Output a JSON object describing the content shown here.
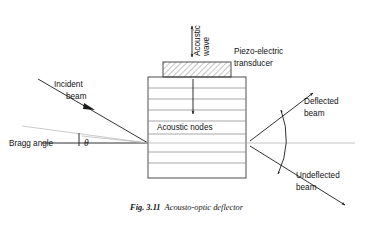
{
  "figure": {
    "caption_number": "Fig. 3.11",
    "caption_text": "Acousto-optic deflector",
    "width": 373,
    "height": 230,
    "background": "#ffffff",
    "ink_color": "#1a1a1a"
  },
  "labels": {
    "acoustic_wave": "Acoustic\nwave",
    "acoustic_wave_line1": "Acoustic",
    "acoustic_wave_line2": "wave",
    "piezo_line1": "Piezo-electric",
    "piezo_line2": "transducer",
    "incident_line1": "Incident",
    "incident_line2": "beam",
    "bragg_angle": "Bragg  angle",
    "theta": "θ",
    "acoustic_nodes": "Acoustic nodes",
    "deflected_line1": "Deflected",
    "deflected_line2": "beam",
    "undeflected_line1": "Undeflected",
    "undeflected_line2": "beam"
  },
  "geometry": {
    "block": {
      "x": 148,
      "y": 77,
      "width": 98,
      "height": 101
    },
    "transducer": {
      "x": 163,
      "y": 62,
      "width": 68,
      "height": 15
    },
    "node_lines_y": [
      88,
      99,
      110,
      121,
      134,
      145,
      156,
      167
    ],
    "interaction_point": {
      "x": 148,
      "y": 143
    },
    "optical_axis_y": 143
  },
  "colors": {
    "ink": "#1a1a1a",
    "block_edge": "#3a3a3a",
    "node_line": "#8a8a8a",
    "faint_line": "#b4b4b4",
    "axis_line": "#aaaaaa",
    "hatch": "#555555",
    "page": "#ffffff"
  }
}
